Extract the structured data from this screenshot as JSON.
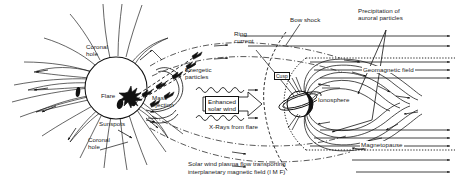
{
  "figure": {
    "kind": "sun-earth-space-weather-diagram",
    "background": "#ffffff",
    "ink": "#111111",
    "width": 455,
    "height": 187
  },
  "labels": {
    "coronal_hole_top": "Coronal\nhole",
    "coronal_hole_bottom": "Coronal\nhole",
    "flare": "Flare",
    "sunspots": "Sunspots",
    "mass_ejection": "Mass\nejection",
    "energetic_particles": "Energetic\nparticles",
    "enhanced_solar_wind": "Enhanced\nsolar wind",
    "xrays_from_flare": "X-Rays from flare",
    "ring_current": "Ring\ncurrent",
    "bow_shock": "Bow shock",
    "precipitation_auroral": "Precipitation of\nauroral particles",
    "geomagnetic_field": "Geomagnetic field",
    "ionosphere": "Ionosphere",
    "magnetopause": "Magnetopause",
    "cusp": "Cusp",
    "caption": "Solar wind plasma flow transporting\ninterplanetary magnetic field (I M F)"
  },
  "elements": {
    "sun_name": "sun-disc",
    "earth_name": "earth-globe",
    "ring_current_name": "ring-current-torus",
    "flare_name": "solar-flare-burst",
    "sunspot_name": "sunspot-blob"
  }
}
